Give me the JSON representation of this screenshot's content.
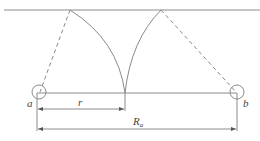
{
  "diagram": {
    "labels": {
      "point_a": "a",
      "point_b": "b",
      "radius": "r",
      "distance_main": "R",
      "distance_sub": "a"
    },
    "colors": {
      "line": "#8a8a8a",
      "text": "#444444",
      "background": "#ffffff"
    }
  }
}
